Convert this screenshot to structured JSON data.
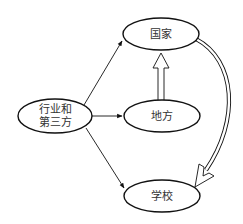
{
  "diagram": {
    "type": "flow-diagram",
    "nodes": [
      {
        "id": "industry",
        "lines": [
          "行业和",
          "第三方"
        ]
      },
      {
        "id": "national",
        "lines": [
          "国家"
        ]
      },
      {
        "id": "local",
        "lines": [
          "地方"
        ]
      },
      {
        "id": "school",
        "lines": [
          "学校"
        ]
      }
    ],
    "edges": [
      {
        "from": "industry",
        "to": "national",
        "style": "thin-arrow"
      },
      {
        "from": "industry",
        "to": "local",
        "style": "thin-arrow"
      },
      {
        "from": "industry",
        "to": "school",
        "style": "thin-arrow"
      },
      {
        "from": "local",
        "to": "national",
        "style": "hollow-double-arrow"
      },
      {
        "from": "national",
        "to": "school",
        "style": "hollow-double-curved-arrow"
      }
    ],
    "colors": {
      "stroke": "#111111",
      "text": "#333333",
      "background": "#ffffff"
    }
  }
}
